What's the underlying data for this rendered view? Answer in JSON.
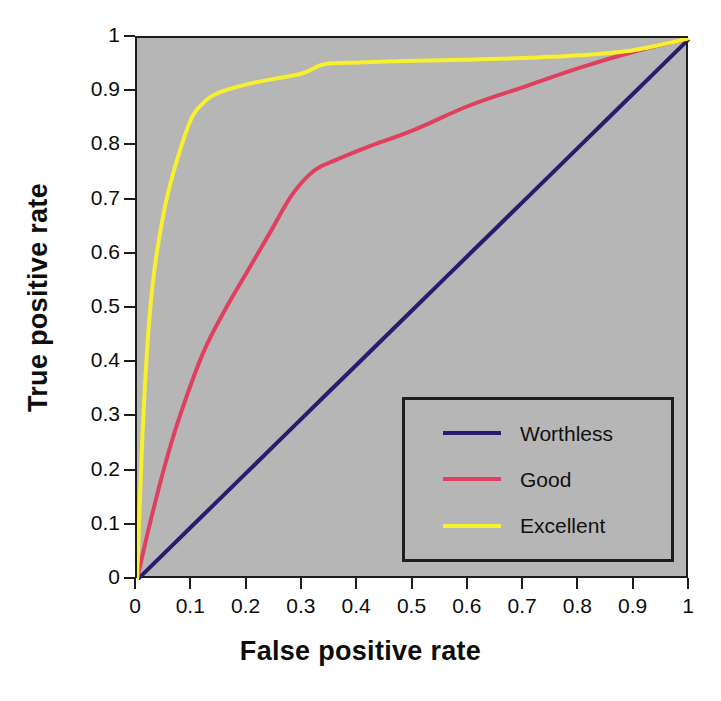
{
  "chart_data": {
    "type": "line",
    "title": "",
    "xlabel": "False positive rate",
    "ylabel": "True positive rate",
    "xlim": [
      0,
      1
    ],
    "ylim": [
      0,
      1
    ],
    "xticks": [
      "0",
      "0.1",
      "0.2",
      "0.3",
      "0.4",
      "0.5",
      "0.6",
      "0.7",
      "0.8",
      "0.9",
      "1"
    ],
    "yticks": [
      "0",
      "0.1",
      "0.2",
      "0.3",
      "0.4",
      "0.5",
      "0.6",
      "0.7",
      "0.8",
      "0.9",
      "1"
    ],
    "grid": false,
    "legend_position": "lower right",
    "background_color": "#b6b6b6",
    "axis_color": "#1d1d1d",
    "series": [
      {
        "name": "Worthless",
        "color": "#2b1a6e",
        "x": [
          0,
          0.1,
          0.2,
          0.3,
          0.4,
          0.5,
          0.6,
          0.7,
          0.8,
          0.9,
          1
        ],
        "y": [
          0,
          0.1,
          0.2,
          0.3,
          0.4,
          0.5,
          0.6,
          0.7,
          0.8,
          0.9,
          1
        ]
      },
      {
        "name": "Good",
        "color": "#e0405f",
        "x": [
          0,
          0.02,
          0.05,
          0.08,
          0.12,
          0.16,
          0.2,
          0.24,
          0.28,
          0.32,
          0.36,
          0.42,
          0.5,
          0.6,
          0.7,
          0.8,
          0.9,
          1.0
        ],
        "y": [
          0,
          0.09,
          0.21,
          0.31,
          0.42,
          0.5,
          0.57,
          0.64,
          0.71,
          0.755,
          0.775,
          0.8,
          0.83,
          0.875,
          0.91,
          0.945,
          0.975,
          1.0
        ]
      },
      {
        "name": "Excellent",
        "color": "#f6f02e",
        "x": [
          0,
          0.01,
          0.02,
          0.03,
          0.045,
          0.06,
          0.08,
          0.1,
          0.125,
          0.15,
          0.2,
          0.25,
          0.3,
          0.34,
          0.4,
          0.5,
          0.6,
          0.7,
          0.8,
          0.9,
          1.0
        ],
        "y": [
          0,
          0.27,
          0.45,
          0.56,
          0.66,
          0.73,
          0.8,
          0.855,
          0.885,
          0.9,
          0.915,
          0.925,
          0.935,
          0.952,
          0.955,
          0.958,
          0.96,
          0.963,
          0.968,
          0.978,
          1.0
        ]
      }
    ]
  },
  "legend": {
    "items": [
      {
        "label": "Worthless",
        "color": "#2b1a6e"
      },
      {
        "label": "Good",
        "color": "#e0405f"
      },
      {
        "label": "Excellent",
        "color": "#f6f02e"
      }
    ]
  }
}
